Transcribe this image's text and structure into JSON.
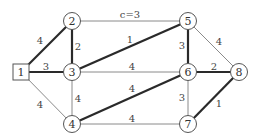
{
  "diagram": {
    "type": "weighted-graph",
    "colors": {
      "thin_edge": "#8a8a8a",
      "thick_edge": "#2a2a2a",
      "node_stroke": "#555555",
      "text": "#333333"
    },
    "nodes": [
      {
        "id": "1",
        "label": "1",
        "shape": "square",
        "x": 21,
        "y": 72
      },
      {
        "id": "2",
        "label": "2",
        "shape": "circle",
        "x": 72,
        "y": 21
      },
      {
        "id": "3",
        "label": "3",
        "shape": "circle",
        "x": 72,
        "y": 72
      },
      {
        "id": "4",
        "label": "4",
        "shape": "circle",
        "x": 72,
        "y": 124
      },
      {
        "id": "5",
        "label": "5",
        "shape": "circle",
        "x": 188,
        "y": 21
      },
      {
        "id": "6",
        "label": "6",
        "shape": "circle",
        "x": 188,
        "y": 72
      },
      {
        "id": "7",
        "label": "7",
        "shape": "circle",
        "x": 188,
        "y": 124
      },
      {
        "id": "8",
        "label": "8",
        "shape": "circle",
        "x": 239,
        "y": 72
      }
    ],
    "edges": [
      {
        "from": "1",
        "to": "2",
        "label": "4",
        "thick": true,
        "lx": 40,
        "ly": 40
      },
      {
        "from": "1",
        "to": "3",
        "label": "3",
        "thick": true,
        "lx": 46,
        "ly": 66
      },
      {
        "from": "1",
        "to": "4",
        "label": "4",
        "thick": false,
        "lx": 40,
        "ly": 104
      },
      {
        "from": "2",
        "to": "3",
        "label": "2",
        "thick": true,
        "lx": 78,
        "ly": 46
      },
      {
        "from": "2",
        "to": "5",
        "label": "c=3",
        "thick": false,
        "lx": 130,
        "ly": 14
      },
      {
        "from": "3",
        "to": "5",
        "label": "1",
        "thick": true,
        "lx": 130,
        "ly": 39
      },
      {
        "from": "3",
        "to": "6",
        "label": "4",
        "thick": false,
        "lx": 132,
        "ly": 66
      },
      {
        "from": "3",
        "to": "4",
        "label": "4",
        "thick": false,
        "lx": 78,
        "ly": 98
      },
      {
        "from": "4",
        "to": "6",
        "label": "4",
        "thick": true,
        "lx": 132,
        "ly": 88
      },
      {
        "from": "4",
        "to": "7",
        "label": "4",
        "thick": false,
        "lx": 132,
        "ly": 118
      },
      {
        "from": "5",
        "to": "6",
        "label": "3",
        "thick": true,
        "lx": 182,
        "ly": 45
      },
      {
        "from": "5",
        "to": "8",
        "label": "4",
        "thick": false,
        "lx": 219,
        "ly": 41
      },
      {
        "from": "6",
        "to": "8",
        "label": "2",
        "thick": true,
        "lx": 214,
        "ly": 66
      },
      {
        "from": "6",
        "to": "7",
        "label": "3",
        "thick": false,
        "lx": 182,
        "ly": 97
      },
      {
        "from": "7",
        "to": "8",
        "label": "1",
        "thick": true,
        "lx": 219,
        "ly": 103
      }
    ]
  }
}
